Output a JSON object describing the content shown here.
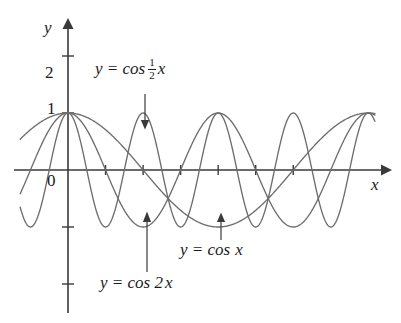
{
  "figure": {
    "type": "graph",
    "background": "#ffffff",
    "curve_color": "#6d6d6d",
    "axis_color": "#3a3a3a",
    "axis_labels": {
      "x": "x",
      "y": "y"
    },
    "origin_label": "0",
    "y_tick_labels": [
      {
        "value": 2,
        "text": "2"
      },
      {
        "value": 1,
        "text": "1"
      }
    ],
    "annotations": [
      {
        "id": "cos-half-x",
        "prefix": "y = cos",
        "numerator": "1",
        "denominator": "2",
        "suffix": "x",
        "arrow": "down"
      },
      {
        "id": "cos-x",
        "text_lead": "y = cos",
        "text_var": "x",
        "arrow": "up"
      },
      {
        "id": "cos-2x",
        "text_lead": "y = cos 2",
        "text_var": "x",
        "arrow": "up"
      }
    ]
  },
  "chart_data": {
    "type": "line",
    "title": "",
    "xlabel": "x",
    "ylabel": "y",
    "xlim": [
      -0.5,
      6.8
    ],
    "ylim": [
      -2.4,
      2.6
    ],
    "grid": false,
    "legend": "inline-annotations",
    "x_tick_values": [
      1.571,
      3.142,
      4.712,
      6.283,
      7.854,
      9.425
    ],
    "x_tick_labels": [
      "",
      "",
      "",
      "",
      "",
      ""
    ],
    "y_tick_values": [
      2,
      1,
      -1,
      -2
    ],
    "y_tick_labels": [
      "2",
      "1",
      "",
      ""
    ],
    "series": [
      {
        "name": "y = cos 2x",
        "expression": "cos(2x)",
        "amplitude": 1,
        "period": 3.1416,
        "color": "#6d6d6d"
      },
      {
        "name": "y = cos x",
        "expression": "cos(x)",
        "amplitude": 1,
        "period": 6.2832,
        "color": "#6d6d6d"
      },
      {
        "name": "y = cos 1/2 x",
        "expression": "cos(0.5x)",
        "amplitude": 1,
        "period": 12.5664,
        "color": "#6d6d6d"
      }
    ]
  }
}
